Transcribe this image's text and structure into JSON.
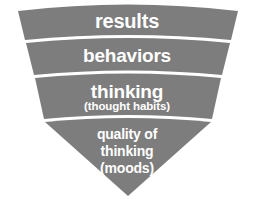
{
  "figure": {
    "name": "inverted-funnel-diagram",
    "background_color": "#ffffff",
    "band_fill_color": "#7d7d7d",
    "divider_color": "#ffffff",
    "text_color": "#ffffff"
  },
  "bands": [
    {
      "id": "results",
      "label": "results",
      "sublabel": ""
    },
    {
      "id": "behaviors",
      "label": "behaviors",
      "sublabel": ""
    },
    {
      "id": "thinking",
      "label": "thinking",
      "sublabel": "(thought habits)"
    },
    {
      "id": "quality-of-thinking",
      "label_line1": "quality of",
      "label_line2": "thinking",
      "label_line3": "(moods)"
    }
  ]
}
